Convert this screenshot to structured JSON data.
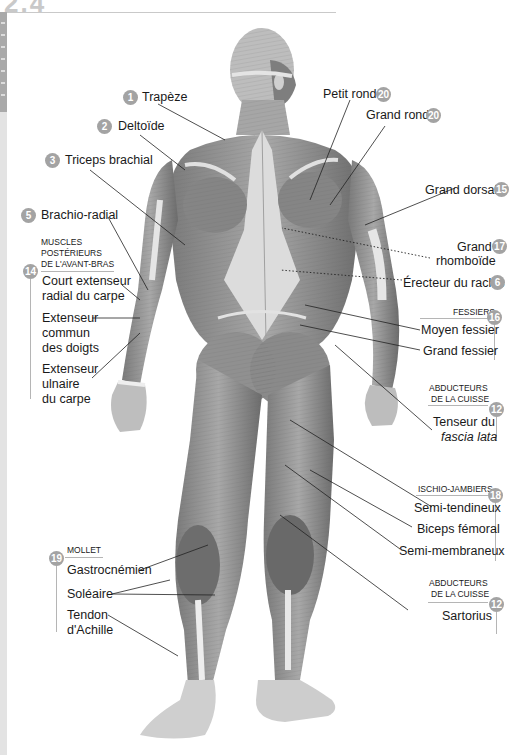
{
  "page": {
    "corner_number": "2.4"
  },
  "labels": {
    "trapeze": {
      "number": "1",
      "text": "Trapèze"
    },
    "deltoide": {
      "number": "2",
      "text": "Deltoïde"
    },
    "triceps": {
      "number": "3",
      "text": "Triceps brachial"
    },
    "brachio_radial": {
      "number": "5",
      "text": "Brachio-radial"
    },
    "petit_rond": {
      "number": "20",
      "text": "Petit rond"
    },
    "grand_rond": {
      "number": "20",
      "text": "Grand rond"
    },
    "grand_dorsal": {
      "number": "15",
      "text": "Grand dorsal"
    },
    "grand_rhomboide": {
      "number": "17",
      "line1": "Grand",
      "line2": "rhomboïde"
    },
    "erecteur": {
      "number": "6",
      "text": "Érecteur du rachis"
    }
  },
  "groups": {
    "avant_bras": {
      "number": "14",
      "title_lines": [
        "MUSCLES",
        "POSTÉRIEURS",
        "DE L'AVANT-BRAS"
      ],
      "items": [
        {
          "line1": "Court extenseur",
          "line2": "radial du carpe"
        },
        {
          "line1": "Extenseur",
          "line2": "commun",
          "line3": "des doigts"
        },
        {
          "line1": "Extenseur",
          "line2": "ulnaire",
          "line3": "du carpe"
        }
      ]
    },
    "fessiers": {
      "number": "16",
      "title": "FESSIERS",
      "items": [
        "Moyen fessier",
        "Grand fessier"
      ]
    },
    "abducteurs_1": {
      "number": "12",
      "title_lines": [
        "ABDUCTEURS",
        "DE LA CUISSE"
      ],
      "item_line1": "Tenseur du",
      "item_line2": "fascia lata"
    },
    "ischio": {
      "number": "18",
      "title": "ISCHIO-JAMBIERS",
      "items": [
        "Semi-tendineux",
        "Biceps fémoral",
        "Semi-membraneux"
      ]
    },
    "abducteurs_2": {
      "number": "12",
      "title_lines": [
        "ABDUCTEURS",
        "DE LA CUISSE"
      ],
      "items": [
        "Sartorius"
      ]
    },
    "mollet": {
      "number": "19",
      "title": "MOLLET",
      "items": [
        "Gastrocnémien",
        "Soléaire"
      ],
      "tendon_line1": "Tendon",
      "tendon_line2": "d'Achille"
    }
  },
  "colors": {
    "badge": "#a3a3a3",
    "rule": "#b5b5b5",
    "text": "#1a1a1a",
    "muscle_dark": "#6e6e6e",
    "muscle_mid": "#9a9a9a",
    "muscle_light": "#d8d8d8"
  }
}
